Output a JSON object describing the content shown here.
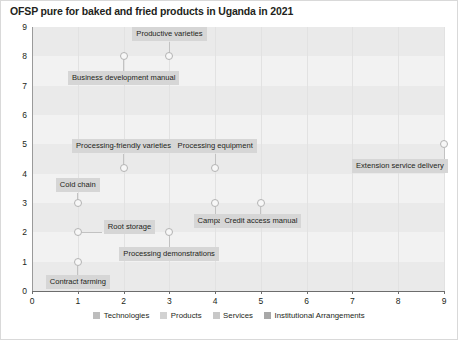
{
  "chart_data": {
    "type": "scatter",
    "title": "OFSP pure for baked and fried products in Uganda in 2021",
    "xlabel": "",
    "ylabel": "",
    "xlim": [
      0,
      9
    ],
    "ylim": [
      0,
      9
    ],
    "xticks": [
      "0",
      "1",
      "2",
      "3",
      "4",
      "5",
      "6",
      "7",
      "8",
      "9"
    ],
    "yticks": [
      "0",
      "1",
      "2",
      "3",
      "4",
      "5",
      "6",
      "7",
      "8",
      "9"
    ],
    "grid": "horizontal-bands-and-vertical-lines",
    "legend_position": "bottom-center",
    "points": [
      {
        "label": "Productive varieties",
        "x": 3,
        "y": 8,
        "label_dx": 0,
        "label_dy": -22,
        "label_align": "center"
      },
      {
        "label": "Business development manual",
        "x": 2,
        "y": 8,
        "label_dx": 0,
        "label_dy": 22,
        "label_align": "center"
      },
      {
        "label": "Processing-friendly varieties",
        "x": 2,
        "y": 4.2,
        "label_dx": 0,
        "label_dy": -22,
        "label_align": "center"
      },
      {
        "label": "Processing equipment",
        "x": 4,
        "y": 4.2,
        "label_dx": 0,
        "label_dy": -22,
        "label_align": "center"
      },
      {
        "label": "Extension service delivery",
        "x": 9,
        "y": 5,
        "label_dx": 0,
        "label_dy": 22,
        "label_align": "right"
      },
      {
        "label": "Cold chain",
        "x": 1,
        "y": 3,
        "label_dx": 0,
        "label_dy": -18,
        "label_align": "center"
      },
      {
        "label": "Campaign",
        "x": 4,
        "y": 3,
        "label_dx": 0,
        "label_dy": 18,
        "label_align": "center"
      },
      {
        "label": "Credit access manual",
        "x": 5,
        "y": 3,
        "label_dx": 0,
        "label_dy": 18,
        "label_align": "center"
      },
      {
        "label": "Root storage",
        "x": 1,
        "y": 2,
        "label_dx": 26,
        "label_dy": -5,
        "label_align": "left"
      },
      {
        "label": "Processing demonstrations",
        "x": 3,
        "y": 2,
        "label_dx": 0,
        "label_dy": 22,
        "label_align": "center"
      },
      {
        "label": "Contract farming",
        "x": 1,
        "y": 1,
        "label_dx": 0,
        "label_dy": 20,
        "label_align": "center"
      }
    ],
    "legend": [
      {
        "name": "Technologies",
        "color": "#bdbdbd"
      },
      {
        "name": "Products",
        "color": "#d2d2d2"
      },
      {
        "name": "Services",
        "color": "#c8c8c8"
      },
      {
        "name": "Institutional Arrangements",
        "color": "#a8a8a8"
      }
    ]
  }
}
